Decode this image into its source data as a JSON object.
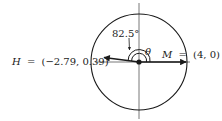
{
  "diagram": {
    "type": "vector-angle-circle",
    "circle": {
      "center": [
        139,
        62
      ],
      "radius": 48
    },
    "angle_label": "82.5°",
    "theta_label": "θ",
    "points": {
      "H": {
        "name": "H",
        "eq": "=",
        "coords": "(−2.79, 0.39)"
      },
      "M": {
        "name": "M",
        "eq": "=",
        "coords": "(4, 0)"
      }
    },
    "colors": {
      "stroke": "#1a1a1a",
      "axis": "#555555",
      "background": "#ffffff"
    }
  }
}
